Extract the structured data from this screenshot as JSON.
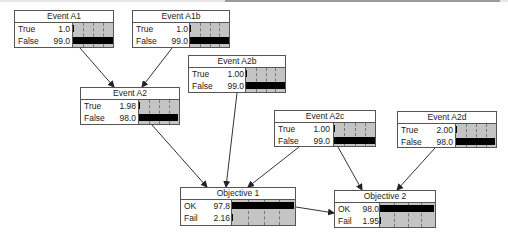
{
  "diagram": {
    "type": "bayesian-network",
    "nodes": [
      {
        "id": "A1",
        "title": "Event A1",
        "x": 14,
        "y": 10,
        "w": 100,
        "h": 38,
        "states": [
          {
            "label": "True",
            "value": "1.0",
            "pct": 1.0
          },
          {
            "label": "False",
            "value": "99.0",
            "pct": 99.0
          }
        ]
      },
      {
        "id": "A1b",
        "title": "Event A1b",
        "x": 132,
        "y": 10,
        "w": 98,
        "h": 38,
        "states": [
          {
            "label": "True",
            "value": "1.0",
            "pct": 1.0
          },
          {
            "label": "False",
            "value": "99.0",
            "pct": 99.0
          }
        ]
      },
      {
        "id": "A2b",
        "title": "Event A2b",
        "x": 188,
        "y": 55,
        "w": 98,
        "h": 38,
        "states": [
          {
            "label": "True",
            "value": "1.00",
            "pct": 1.0
          },
          {
            "label": "False",
            "value": "99.0",
            "pct": 99.0
          }
        ]
      },
      {
        "id": "A2",
        "title": "Event A2",
        "x": 80,
        "y": 87,
        "w": 100,
        "h": 38,
        "states": [
          {
            "label": "True",
            "value": "1.98",
            "pct": 1.98
          },
          {
            "label": "False",
            "value": "98.0",
            "pct": 98.0
          }
        ]
      },
      {
        "id": "A2c",
        "title": "Event A2c",
        "x": 274,
        "y": 110,
        "w": 102,
        "h": 37,
        "states": [
          {
            "label": "True",
            "value": "1.00",
            "pct": 1.0
          },
          {
            "label": "False",
            "value": "99.0",
            "pct": 99.0
          }
        ]
      },
      {
        "id": "A2d",
        "title": "Event A2d",
        "x": 397,
        "y": 111,
        "w": 100,
        "h": 37,
        "states": [
          {
            "label": "True",
            "value": "2.00",
            "pct": 2.0
          },
          {
            "label": "False",
            "value": "98.0",
            "pct": 98.0
          }
        ]
      },
      {
        "id": "O1",
        "title": "Objective 1",
        "x": 180,
        "y": 187,
        "w": 116,
        "h": 39,
        "states": [
          {
            "label": "OK",
            "value": "97.8",
            "pct": 97.8
          },
          {
            "label": "Fail",
            "value": "2.16",
            "pct": 2.16
          }
        ]
      },
      {
        "id": "O2",
        "title": "Objective 2",
        "x": 334,
        "y": 190,
        "w": 102,
        "h": 38,
        "states": [
          {
            "label": "OK",
            "value": "98.0",
            "pct": 98.0
          },
          {
            "label": "Fail",
            "value": "1.95",
            "pct": 1.95
          }
        ]
      }
    ],
    "edges": [
      {
        "from": "A1",
        "to": "A2",
        "x1": 80,
        "y1": 48,
        "x2": 114,
        "y2": 87
      },
      {
        "from": "A1b",
        "to": "A2",
        "x1": 172,
        "y1": 48,
        "x2": 142,
        "y2": 87
      },
      {
        "from": "A2",
        "to": "O1",
        "x1": 152,
        "y1": 125,
        "x2": 207,
        "y2": 187
      },
      {
        "from": "A2b",
        "to": "O1",
        "x1": 237,
        "y1": 93,
        "x2": 226,
        "y2": 187
      },
      {
        "from": "A2c",
        "to": "O1",
        "x1": 299,
        "y1": 147,
        "x2": 248,
        "y2": 187
      },
      {
        "from": "A2c",
        "to": "O2",
        "x1": 338,
        "y1": 147,
        "x2": 362,
        "y2": 190
      },
      {
        "from": "A2d",
        "to": "O2",
        "x1": 435,
        "y1": 148,
        "x2": 397,
        "y2": 190
      },
      {
        "from": "O1",
        "to": "O2",
        "x1": 296,
        "y1": 207,
        "x2": 334,
        "y2": 213
      }
    ],
    "colors": {
      "bar_fill": "#000000",
      "bar_background": "#c4c4c4",
      "border": "#555555",
      "edge": "#333333"
    }
  }
}
